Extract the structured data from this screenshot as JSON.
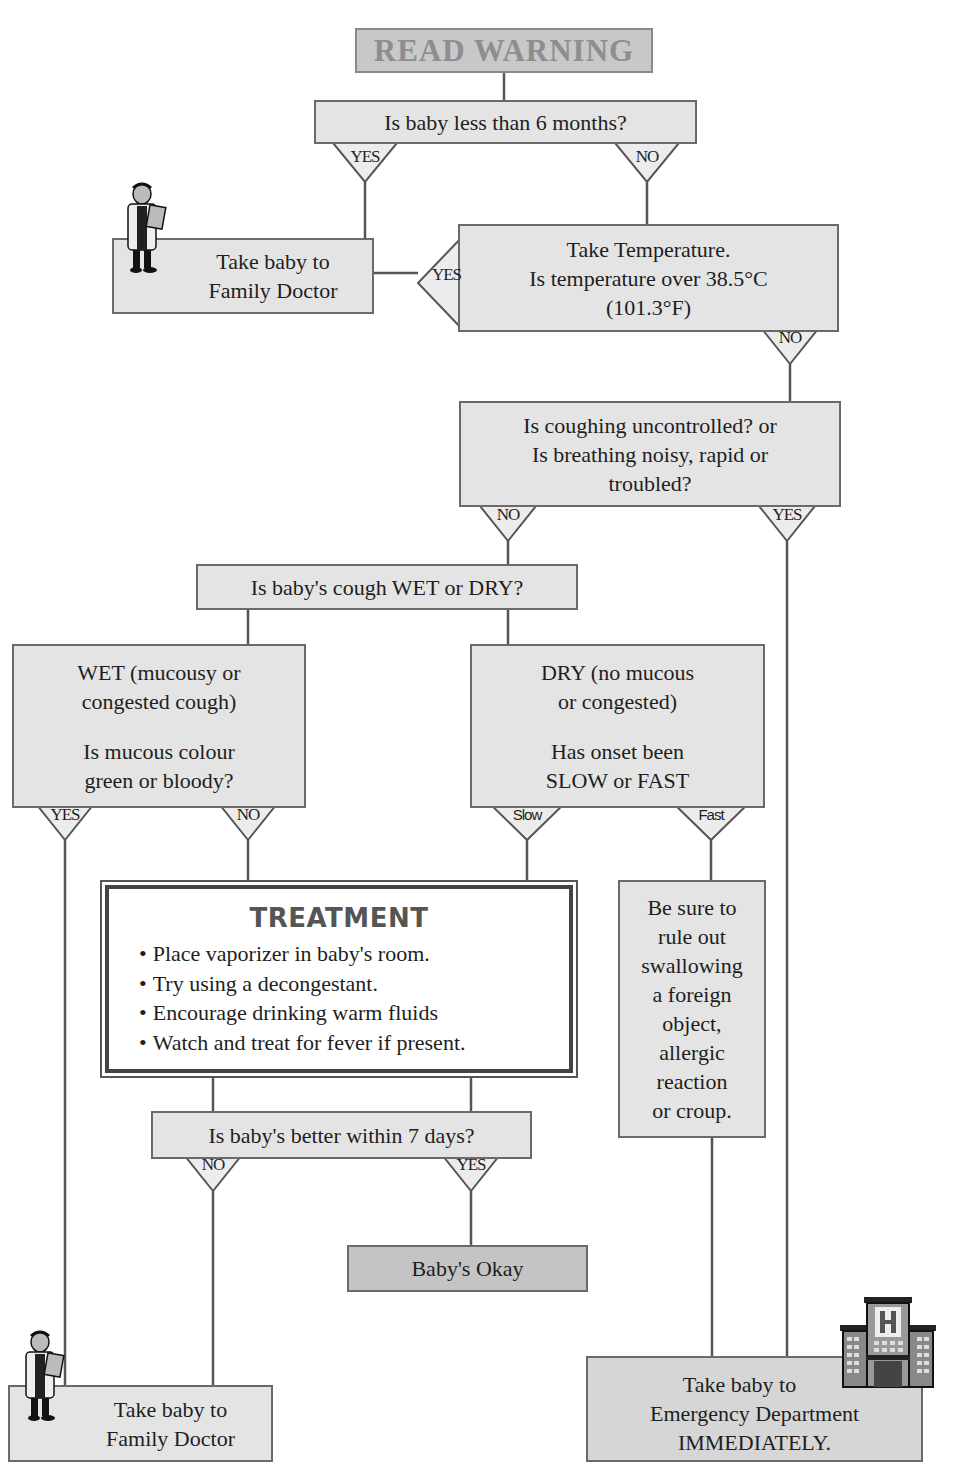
{
  "title": "READ WARNING",
  "nodes": {
    "age_question": "Is baby less than 6 months?",
    "family_doctor_top": [
      "Take baby to",
      "Family Doctor"
    ],
    "temperature": [
      "Take Temperature.",
      "Is temperature over 38.5°C",
      "(101.3°F)"
    ],
    "breathing": [
      "Is coughing uncontrolled? or",
      "Is breathing noisy, rapid or",
      "troubled?"
    ],
    "cough_type": "Is baby's cough WET or DRY?",
    "wet": {
      "line1": [
        "WET (mucousy or",
        "congested cough)"
      ],
      "line2": [
        "Is mucous colour",
        "green or bloody?"
      ]
    },
    "dry": {
      "line1": [
        "DRY (no mucous",
        "or congested)"
      ],
      "line2": [
        "Has onset been",
        "SLOW or FAST"
      ]
    },
    "treatment": {
      "title": "TREATMENT",
      "items": [
        "Place vaporizer in baby's room.",
        "Try using a decongestant.",
        "Encourage drinking warm fluids",
        "Watch and treat for fever if present."
      ]
    },
    "rule_out": [
      "Be sure to",
      "rule out",
      "swallowing",
      "a foreign",
      "object,",
      "allergic",
      "reaction",
      "or croup."
    ],
    "better_question": "Is baby's better within 7 days?",
    "okay": "Baby's Okay",
    "family_doctor_bottom": [
      "Take baby to",
      "Family Doctor"
    ],
    "emergency": [
      "Take baby to",
      "Emergency Department",
      "IMMEDIATELY."
    ]
  },
  "branches": {
    "age_yes": "YES",
    "age_no": "NO",
    "temp_yes": "YES",
    "temp_no": "NO",
    "breath_no": "NO",
    "breath_yes": "YES",
    "wet_yes": "YES",
    "wet_no": "NO",
    "dry_slow": "Slow",
    "dry_fast": "Fast",
    "better_no": "NO",
    "better_yes": "YES"
  },
  "icons": {
    "doctor": "doctor-icon",
    "hospital": "hospital-icon"
  },
  "colors": {
    "box_light": "#e4e4e4",
    "box_dark": "#c4c4c4",
    "border": "#6a6a6a",
    "line": "#555555"
  }
}
